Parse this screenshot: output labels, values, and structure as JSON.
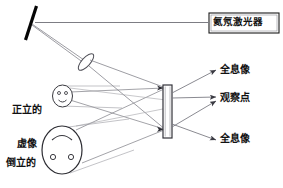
{
  "diagram": {
    "title_text": "",
    "type": "optics-holography-setup",
    "colors": {
      "ink": "#111111",
      "ray": "#6e6e76",
      "mirror": "#000000",
      "plate_stroke": "#4a4a52",
      "background": "#ffffff"
    },
    "laser": {
      "label": "氦氖激光器"
    },
    "images": {
      "virtual": {
        "line1": "正立的",
        "line2": "虚像",
        "label": "正立的\n虚像"
      },
      "real": {
        "line1": "倒立的",
        "line2": "实像",
        "label": "倒立的\n实像"
      }
    },
    "outputs": {
      "hologram_top": "全息像",
      "observation_point": "观察点",
      "hologram_bottom": "全息像"
    },
    "components": {
      "mirror_name": "mirror",
      "lens_name": "lens",
      "plate_name": "holographic-plate"
    }
  }
}
